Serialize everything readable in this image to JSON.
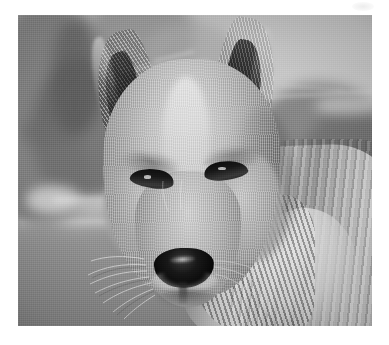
{
  "page": {
    "background_color": "#ffffff",
    "width": 389,
    "height": 345
  },
  "photo": {
    "alt_text": "Dingo head portrait",
    "subject": "dingo",
    "view": "head-and-shoulders front portrait",
    "color_mode": "grayscale",
    "frame": {
      "left": 18,
      "top": 15,
      "width": 354,
      "height": 311
    },
    "palette": {
      "sky": "#c4c4c4",
      "ground": "#909090",
      "fur_light": "#d2d2d2",
      "fur_mid": "#a6a6a6",
      "fur_dark": "#6d6d6d",
      "ear_dark": "#262626",
      "nose_black": "#0a0a0a",
      "eye_black": "#141414",
      "highlight": "#ececec"
    },
    "regions": [
      {
        "name": "background-sky",
        "description": "pale blurred sky upper area"
      },
      {
        "name": "background-trees",
        "description": "out-of-focus dark tree and shrub masses"
      },
      {
        "name": "background-ground",
        "description": "flat blurred grassy ground below horizon"
      },
      {
        "name": "left-ear",
        "description": "dark pointed erect ear, animal's right"
      },
      {
        "name": "right-ear",
        "description": "dark pointed erect ear, animal's left"
      },
      {
        "name": "forehead-blaze",
        "description": "pale stripe down centre of face"
      },
      {
        "name": "left-eye",
        "description": "narrowed dark almond eye"
      },
      {
        "name": "right-eye",
        "description": "narrowed dark almond eye"
      },
      {
        "name": "muzzle",
        "description": "tapering snout with light fur"
      },
      {
        "name": "nose",
        "description": "broad black nose pad with specular highlight"
      },
      {
        "name": "whiskers",
        "description": "fine pale whiskers fanning from muzzle sides"
      },
      {
        "name": "neck-ruff",
        "description": "thick streaked fur of neck and shoulder"
      }
    ]
  },
  "artifact": {
    "name": "scanner-smudge",
    "description": "faint pale smudge near top-right margin"
  }
}
